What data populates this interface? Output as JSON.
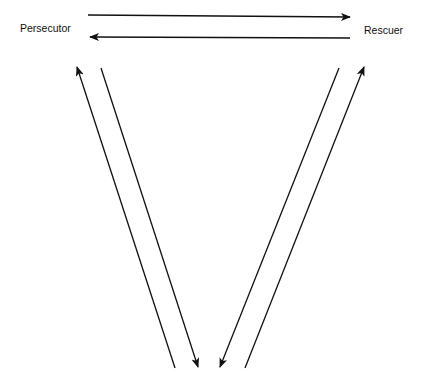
{
  "nodes": [
    {
      "id": "persecutor",
      "label": "Persecutor"
    },
    {
      "id": "rescuer",
      "label": "Rescuer"
    },
    {
      "id": "victim",
      "label": ""
    }
  ],
  "edges": [
    {
      "from": "persecutor",
      "to": "rescuer"
    },
    {
      "from": "rescuer",
      "to": "persecutor"
    },
    {
      "from": "victim",
      "to": "persecutor"
    },
    {
      "from": "persecutor",
      "to": "victim"
    },
    {
      "from": "rescuer",
      "to": "victim"
    },
    {
      "from": "victim",
      "to": "rescuer"
    }
  ],
  "colors": {
    "stroke": "#111111",
    "background": "#ffffff"
  }
}
